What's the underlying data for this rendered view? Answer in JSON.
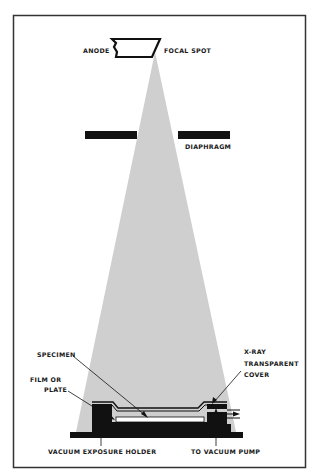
{
  "labels": {
    "anode": "ANODE",
    "focal_spot": "FOCAL SPOT",
    "diaphragm": "DIAPHRAGM",
    "specimen": "SPECIMEN",
    "film_line1": "FILM OR",
    "film_line2": "PLATE",
    "cover_line1": "X-RAY",
    "cover_line2": "TRANSPARENT",
    "cover_line3": "COVER",
    "holder": "VACUUM EXPOSURE HOLDER",
    "pump": "TO VACUUM PUMP"
  },
  "colors": {
    "beam": "#cfcfcf",
    "ink": "#111111",
    "frame": "#333333",
    "background": "#ffffff"
  }
}
